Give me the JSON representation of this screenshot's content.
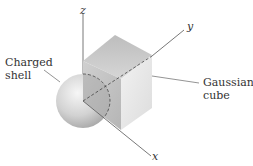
{
  "diagram": {
    "labels": {
      "shell_line1": "Charged",
      "shell_line2": "shell",
      "cube_line1": "Gaussian",
      "cube_line2": "cube"
    },
    "axes": {
      "x": "x",
      "y": "y",
      "z": "z"
    },
    "colors": {
      "line": "#555555",
      "cube_top": "#c9c9c9",
      "cube_front": "#dedede",
      "cube_right": "#eeeeee",
      "sphere_light": "#f4f4f4",
      "sphere_dark": "#a8a8a8"
    }
  }
}
